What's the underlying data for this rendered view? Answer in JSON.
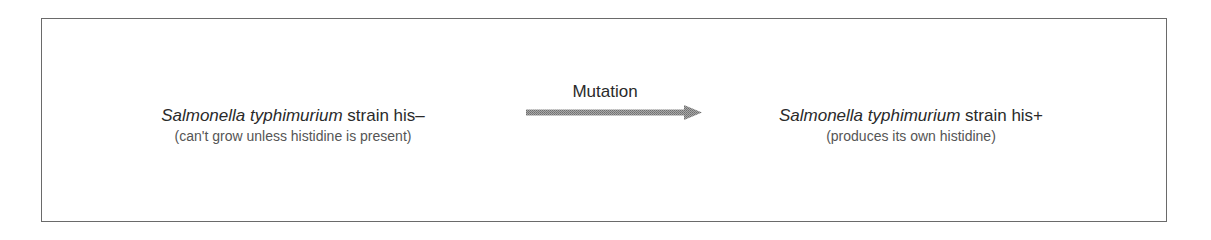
{
  "diagram": {
    "left_strain": {
      "species": "Salmonella typhimurium",
      "strain_label": " strain his–",
      "description": "(can't grow unless histidine is present)"
    },
    "transition": {
      "label": "Mutation",
      "icon": "right-arrow-icon",
      "arrow_color": "#8c8c8c"
    },
    "right_strain": {
      "species": "Salmonella typhimurium",
      "strain_label": " strain his+",
      "description": "(produces its own histidine)"
    },
    "colors": {
      "border": "#6a6a6a",
      "text_primary": "#2a2a2a",
      "text_secondary": "#555555"
    }
  }
}
